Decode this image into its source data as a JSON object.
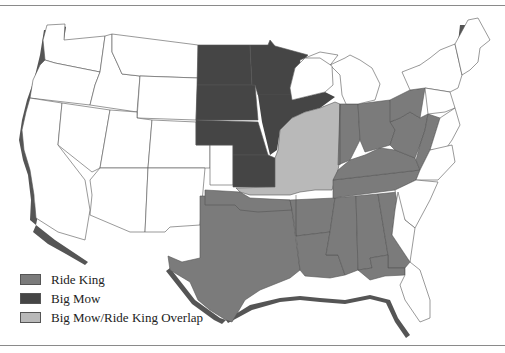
{
  "legend": {
    "items": [
      {
        "label": "Ride King",
        "color": "#7b7b7b"
      },
      {
        "label": "Big Mow",
        "color": "#454545"
      },
      {
        "label": "Big Mow/Ride King Overlap",
        "color": "#b9b9b9"
      }
    ]
  },
  "map": {
    "title": "United States map showing Ride King and Big Mow regions",
    "colors": {
      "ride_king": "#7b7b7b",
      "big_mow": "#454545",
      "overlap": "#b9b9b9",
      "no_coverage": "#ffffff",
      "coast_shadow": "#555555",
      "border": "#555555"
    },
    "regions": {
      "big_mow": [
        "North Dakota",
        "South Dakota",
        "Nebraska",
        "Minnesota",
        "Kansas (partial)",
        "Iowa (partial)",
        "Wisconsin (partial)"
      ],
      "overlap": [
        "Iowa (partial)",
        "Illinois",
        "Missouri (partial)",
        "Wisconsin (partial)",
        "Oklahoma/Kansas border strip"
      ],
      "ride_king": [
        "Texas",
        "Oklahoma",
        "Arkansas",
        "Louisiana",
        "Mississippi",
        "Alabama",
        "Georgia (partial)",
        "Tennessee",
        "Kentucky",
        "Indiana",
        "Ohio",
        "West Virginia",
        "Pennsylvania (partial)",
        "Virginia (partial)",
        "Florida panhandle"
      ]
    }
  }
}
